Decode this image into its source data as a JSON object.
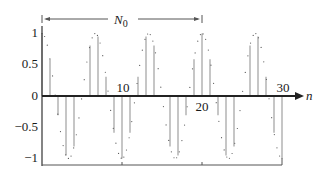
{
  "chart_data": {
    "type": "stem",
    "title": "",
    "xlabel": "n",
    "ylabel": "",
    "x": [
      0,
      1,
      2,
      3,
      4,
      5,
      6,
      7,
      8,
      9,
      10,
      11,
      12,
      13,
      14,
      15,
      16,
      17,
      18,
      19,
      20,
      21,
      22,
      23,
      24,
      25,
      26,
      27,
      28,
      29,
      30
    ],
    "series": [
      {
        "name": "x[n] = cos(0.3πn) samples",
        "style": "stem",
        "values": [
          1,
          0.588,
          -0.309,
          -0.951,
          -0.809,
          0,
          0.809,
          0.951,
          0.309,
          -0.588,
          -1,
          -0.588,
          0.309,
          0.951,
          0.809,
          0,
          -0.809,
          -0.951,
          -0.309,
          0.588,
          1,
          0.588,
          -0.309,
          -0.951,
          -0.809,
          0,
          0.809,
          0.951,
          0.309,
          -0.588,
          -1
        ]
      },
      {
        "name": "underlying continuous cosine",
        "style": "dotted",
        "function": "cos(0.3πt)"
      }
    ],
    "xticks": [
      10,
      20,
      30
    ],
    "xtick_labels": [
      "10",
      "20",
      "30"
    ],
    "yticks": [
      1,
      0.5,
      0,
      -0.5,
      -1
    ],
    "ytick_labels": [
      "1",
      "0.5",
      "0",
      "−0.5",
      "−1"
    ],
    "xlim": [
      0,
      30
    ],
    "ylim": [
      -1,
      1
    ],
    "grid": false,
    "annotations": [
      {
        "type": "double-arrow",
        "from": 0,
        "to": 20,
        "label_main": "N",
        "label_sub": "0"
      }
    ]
  },
  "colors": {
    "stem": "#b8b8b8",
    "dots": "#555555",
    "axis": "#333333"
  }
}
